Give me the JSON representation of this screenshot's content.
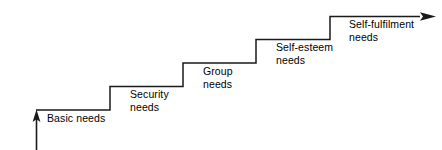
{
  "diagram": {
    "type": "staircase",
    "stroke_color": "#1a1a1a",
    "background_color": "#ffffff",
    "start_arrow": "up-arrow",
    "end_arrow": "right-arrow",
    "steps": [
      {
        "id": "basic",
        "label": "Basic needs",
        "level": 1
      },
      {
        "id": "security",
        "label": "Security\nneeds",
        "level": 2
      },
      {
        "id": "group",
        "label": "Group\nneeds",
        "level": 3
      },
      {
        "id": "self-esteem",
        "label": "Self-esteem\nneeds",
        "level": 4
      },
      {
        "id": "self-fulfilment",
        "label": "Self-fulfilment\nneeds",
        "level": 5
      }
    ]
  }
}
